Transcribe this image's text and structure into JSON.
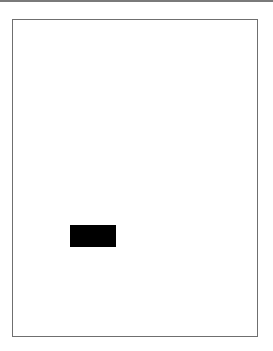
{
  "document": {
    "page": {
      "border_color": "#6f6f6f",
      "background": "#ffffff",
      "blocks": [
        {
          "type": "redaction-box",
          "color": "#000000"
        }
      ]
    },
    "top_rule_color": "#7a7a7a"
  }
}
